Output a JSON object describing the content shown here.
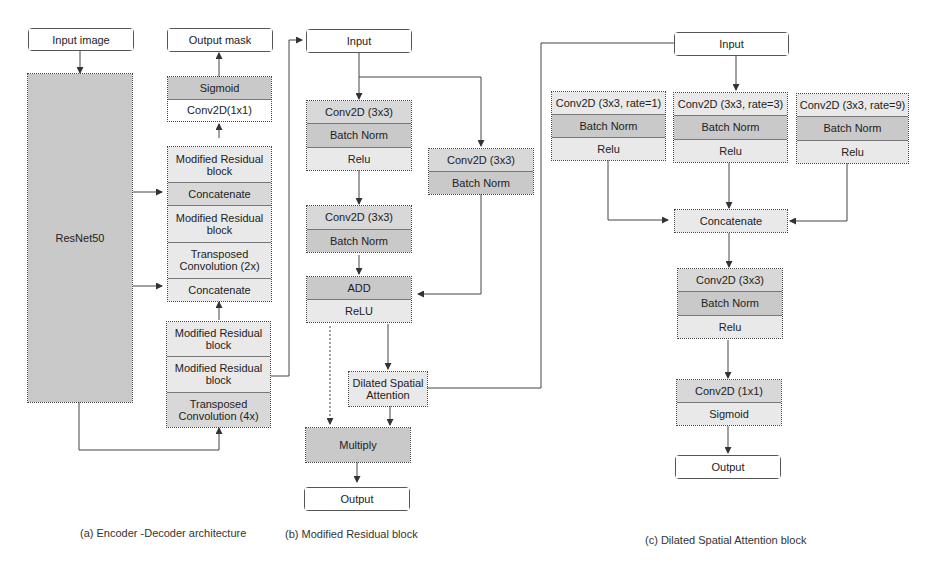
{
  "panel_a": {
    "input": "Input image",
    "encoder": "ResNet50",
    "output": "Output mask",
    "head": [
      "Sigmoid",
      "Conv2D(1x1)"
    ],
    "decoder_upper": [
      "Modified Residual block",
      "Concatenate",
      "Modified Residual block",
      "Transposed Convolution (2x)",
      "Concatenate"
    ],
    "decoder_lower": [
      "Modified Residual block",
      "Modified Residual block",
      "Transposed Convolution (4x)"
    ],
    "caption": "(a) Encoder -Decoder architecture"
  },
  "panel_b": {
    "input": "Input",
    "main_block1": [
      "Conv2D (3x3)",
      "Batch Norm",
      "Relu"
    ],
    "main_block2": [
      "Conv2D (3x3)",
      "Batch Norm"
    ],
    "shortcut": [
      "Conv2D (3x3)",
      "Batch Norm"
    ],
    "merge": [
      "ADD",
      "ReLU"
    ],
    "attention": "Dilated Spatial Attention",
    "multiply": "Multiply",
    "output": "Output",
    "caption": "(b) Modified Residual block"
  },
  "panel_c": {
    "input": "Input",
    "branches": [
      [
        "Conv2D (3x3, rate=1)",
        "Batch Norm",
        "Relu"
      ],
      [
        "Conv2D (3x3, rate=3)",
        "Batch Norm",
        "Relu"
      ],
      [
        "Conv2D (3x3, rate=9)",
        "Batch Norm",
        "Relu"
      ]
    ],
    "concat": "Concatenate",
    "block": [
      "Conv2D (3x3)",
      "Batch Norm",
      "Relu"
    ],
    "head": [
      "Conv2D (1x1)",
      "Sigmoid"
    ],
    "output": "Output",
    "caption": "(c) Dilated Spatial Attention block"
  }
}
